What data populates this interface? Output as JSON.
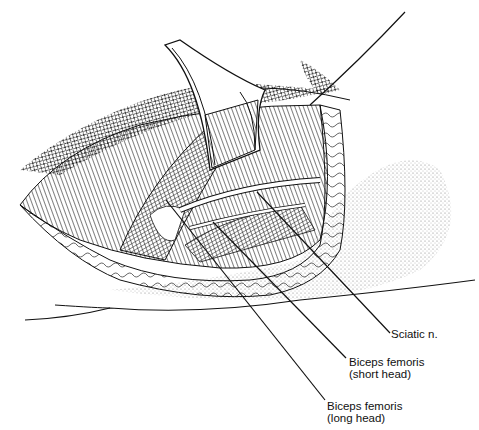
{
  "figure": {
    "labels": [
      {
        "id": "sciatic",
        "line1": "Sciatic n.",
        "line2": ""
      },
      {
        "id": "short_head",
        "line1": "Biceps femoris",
        "line2": "(short head)"
      },
      {
        "id": "long_head",
        "line1": "Biceps femoris",
        "line2": "(long head)"
      }
    ]
  },
  "colors": {
    "ink": "#111111",
    "background": "#ffffff",
    "stipple": "#888888"
  }
}
